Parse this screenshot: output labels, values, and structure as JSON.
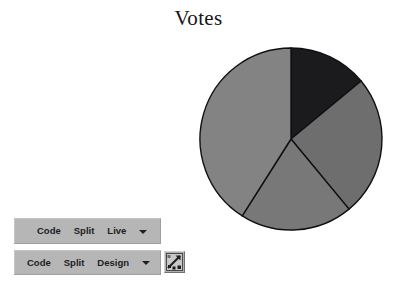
{
  "chart_data": {
    "type": "pie",
    "title": "Votes",
    "xlabel": "",
    "ylabel": "",
    "legend": "none",
    "grid": false,
    "start_angle_deg": 0,
    "direction": "clockwise",
    "categories": [
      "Slice 1",
      "Slice 2",
      "Slice 3",
      "Slice 4"
    ],
    "values": [
      14,
      25,
      20,
      41
    ],
    "angles_deg": [
      52,
      91,
      70,
      147
    ],
    "colors": [
      "#1b1b1d",
      "#6e6e6e",
      "#787878",
      "#838383"
    ],
    "stroke_color": "#101014",
    "center_px": [
      291,
      139
    ],
    "radius_px": 92
  },
  "title": {
    "text": "Votes"
  },
  "toolbar_live": {
    "items": [
      {
        "label": "Code"
      },
      {
        "label": "Split"
      },
      {
        "label": "Live"
      }
    ],
    "caret": "▾"
  },
  "toolbar_design": {
    "items": [
      {
        "label": "Code"
      },
      {
        "label": "Split"
      },
      {
        "label": "Design"
      }
    ],
    "caret": "▾",
    "icon_button": {
      "name": "live-view-icon"
    }
  }
}
